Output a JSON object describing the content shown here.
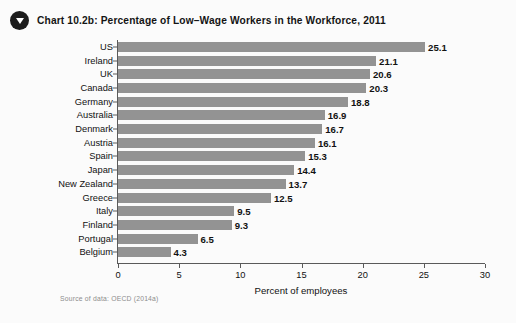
{
  "header": {
    "icon": "triangle-down-bullet-icon",
    "title": "Chart 10.2b:  Percentage of Low–Wage Workers in the Workforce, 2011"
  },
  "source": {
    "text": "Source of data: OECD (2014a)"
  },
  "colors": {
    "bar": "#939393",
    "axis": "#5a5a5a",
    "text": "#111111",
    "background": "#fbfbfb",
    "bullet": "#1c1c1c"
  },
  "chart_data": {
    "type": "bar",
    "orientation": "horizontal",
    "title": "Chart 10.2b:  Percentage of Low–Wage Workers in the Workforce, 2011",
    "xlabel": "Percent of employees",
    "ylabel": "",
    "xlim": [
      0,
      30
    ],
    "xticks": [
      0,
      5,
      10,
      15,
      20,
      25,
      30
    ],
    "grid": false,
    "legend": false,
    "categories": [
      "US",
      "Ireland",
      "UK",
      "Canada",
      "Germany",
      "Australia",
      "Denmark",
      "Austria",
      "Spain",
      "Japan",
      "New Zealand",
      "Greece",
      "Italy",
      "Finland",
      "Portugal",
      "Belgium"
    ],
    "values": [
      25.1,
      21.1,
      20.6,
      20.3,
      18.8,
      16.9,
      16.7,
      16.1,
      15.3,
      14.4,
      13.7,
      12.5,
      9.5,
      9.3,
      6.5,
      4.3
    ],
    "value_labels": [
      "25.1",
      "21.1",
      "20.6",
      "20.3",
      "18.8",
      "16.9",
      "16.7",
      "16.1",
      "15.3",
      "14.4",
      "13.7",
      "12.5",
      "9.5",
      "9.3",
      "6.5",
      "4.3"
    ]
  }
}
